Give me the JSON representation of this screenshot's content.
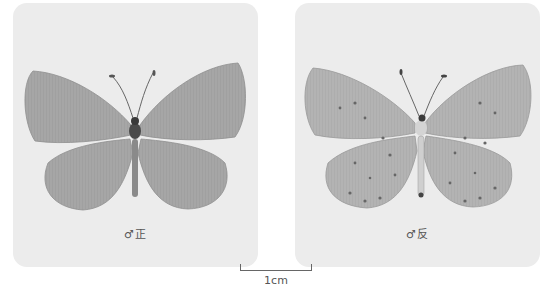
{
  "panels": [
    {
      "caption": "♂正",
      "view": "dorsal (upperside)",
      "wing_color": "#a9a9a9",
      "has_spots": false
    },
    {
      "caption": "♂反",
      "view": "ventral (underside)",
      "wing_color": "#b5b5b5",
      "has_spots": true
    }
  ],
  "scale_bar": {
    "label": "1cm"
  },
  "colors": {
    "panel_bg": "#ececec",
    "page_bg": "#ffffff",
    "text": "#555555"
  }
}
